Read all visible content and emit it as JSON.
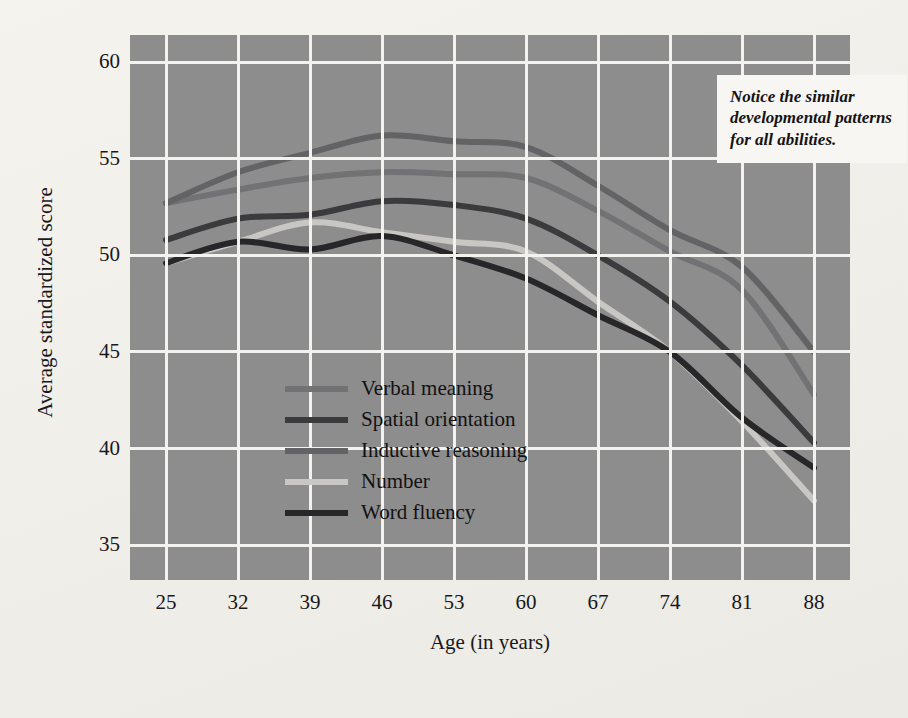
{
  "figure": {
    "background_color": "#f2f1ec",
    "plot_background_color": "#8d8d8d",
    "gridline_color": "#f3f2ee"
  },
  "callout": {
    "name": "annotation-callout",
    "text": "Notice the similar developmental patterns for all abilities.",
    "background_color": "#f7f6f2"
  },
  "chart_data": {
    "type": "line",
    "title": "",
    "xlabel": "Age (in years)",
    "ylabel": "Average standardized score",
    "categories": [
      25,
      32,
      39,
      46,
      53,
      60,
      67,
      74,
      81,
      88
    ],
    "x": [
      25,
      32,
      39,
      46,
      53,
      60,
      67,
      74,
      81,
      88
    ],
    "xlim": [
      21.5,
      91.5
    ],
    "ylim": [
      33.2,
      61.4
    ],
    "yticks": [
      35,
      40,
      45,
      50,
      55,
      60
    ],
    "xticks": [
      25,
      32,
      39,
      46,
      53,
      60,
      67,
      74,
      81,
      88
    ],
    "grid": true,
    "legend_position": "inside-lower-left",
    "series": [
      {
        "name": "Verbal meaning",
        "color": "#727173",
        "values": [
          52.7,
          53.4,
          54.0,
          54.3,
          54.2,
          54.0,
          52.3,
          50.2,
          48.2,
          42.8
        ]
      },
      {
        "name": "Spatial orientation",
        "color": "#3b3a3c",
        "values": [
          50.8,
          51.9,
          52.1,
          52.8,
          52.6,
          51.9,
          50.0,
          47.6,
          44.3,
          40.3
        ]
      },
      {
        "name": "Inductive reasoning",
        "color": "#636264",
        "values": [
          52.7,
          54.3,
          55.3,
          56.2,
          55.9,
          55.6,
          53.6,
          51.3,
          49.4,
          45.0
        ]
      },
      {
        "name": "Number",
        "color": "#c8c7c3",
        "values": [
          49.6,
          50.7,
          51.7,
          51.2,
          50.7,
          50.2,
          47.6,
          45.0,
          41.4,
          37.3
        ]
      },
      {
        "name": "Word fluency",
        "color": "#272628",
        "values": [
          49.6,
          50.7,
          50.3,
          51.0,
          50.0,
          48.8,
          46.9,
          45.0,
          41.6,
          39.0
        ]
      }
    ]
  }
}
